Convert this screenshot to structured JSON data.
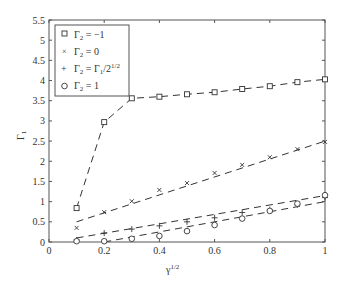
{
  "chart_data": {
    "type": "line",
    "title": "",
    "xlabel": "γ^1/2",
    "ylabel": "Γ1",
    "xlim": [
      0,
      1
    ],
    "ylim": [
      0,
      5.5
    ],
    "xticks": [
      "0",
      "0.2",
      "0.4",
      "0.6",
      "0.8",
      "1"
    ],
    "yticks": [
      "0",
      "0.5",
      "1",
      "1.5",
      "2",
      "2.5",
      "3",
      "3.5",
      "4",
      "4.5",
      "5",
      "5.5"
    ],
    "grid": false,
    "legend_position": "upper left",
    "x": [
      0.1,
      0.2,
      0.3,
      0.4,
      0.5,
      0.6,
      0.7,
      0.8,
      0.9,
      1.0
    ],
    "series": [
      {
        "name": "Γ2 = −1",
        "marker": "square",
        "values": [
          0.84,
          2.97,
          3.56,
          3.6,
          3.66,
          3.71,
          3.79,
          3.86,
          3.96,
          4.03
        ],
        "fit": [
          [
            0.1,
            0.84
          ],
          [
            0.2,
            2.97
          ],
          [
            0.3,
            3.56
          ],
          [
            0.4,
            3.6
          ],
          [
            0.5,
            3.66
          ],
          [
            0.6,
            3.71
          ],
          [
            0.7,
            3.79
          ],
          [
            0.8,
            3.86
          ],
          [
            0.9,
            3.96
          ],
          [
            1.0,
            4.03
          ]
        ]
      },
      {
        "name": "Γ2 = 0",
        "marker": "x",
        "values": [
          0.35,
          0.74,
          1.01,
          1.29,
          1.46,
          1.71,
          1.91,
          2.1,
          2.3,
          2.48
        ],
        "fit": [
          [
            0.1,
            0.5
          ],
          [
            1.0,
            2.5
          ]
        ]
      },
      {
        "name": "Γ2 = Γ1/2^1/2",
        "marker": "plus",
        "values": [
          0.05,
          0.22,
          0.32,
          0.4,
          0.5,
          0.6,
          0.73,
          0.8,
          0.92,
          1.1
        ],
        "fit": [
          [
            0.1,
            0.1
          ],
          [
            1.0,
            1.15
          ]
        ]
      },
      {
        "name": "Γ2 = 1",
        "marker": "circle",
        "values": [
          0.02,
          0.02,
          0.08,
          0.15,
          0.27,
          0.42,
          0.58,
          0.77,
          0.95,
          1.16
        ],
        "fit": [
          [
            0.2,
            0.0
          ],
          [
            1.0,
            1.0
          ]
        ]
      }
    ]
  },
  "legend": {
    "items": [
      {
        "marker": "□",
        "label": "Γ",
        "sub": "2",
        "rest": " = −1"
      },
      {
        "marker": "×",
        "label": "Γ",
        "sub": "2",
        "rest": " = 0"
      },
      {
        "marker": "+",
        "label": "Γ",
        "sub": "2",
        "rest": " = Γ",
        "sub2": "1",
        "rest2": "/2",
        "sup": "1/2"
      },
      {
        "marker": "○",
        "label": "Γ",
        "sub": "2",
        "rest": " = 1"
      }
    ]
  },
  "axes": {
    "xlabel_main": "γ",
    "xlabel_sup": "1/2",
    "ylabel_main": "Γ",
    "ylabel_sub": "1"
  },
  "colors": {
    "axis": "#555555",
    "series": "#333333",
    "text": "#333333"
  }
}
